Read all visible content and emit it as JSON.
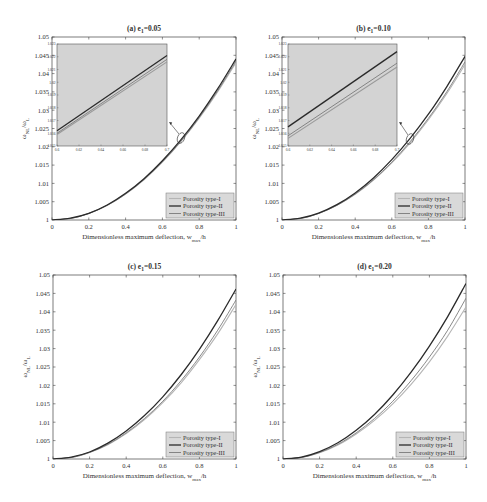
{
  "figure": {
    "xlabel": "Dimensionless maximum deflection, w",
    "xlabel_sub": "max",
    "xlabel_tail": "/h",
    "ylabel_main": "ω",
    "ylabel_sub1": "NL",
    "ylabel_mid": "/ω",
    "ylabel_sub2": "L",
    "legend": [
      "Porosity type-I",
      "Porosity type-II",
      "Porosity type-III"
    ],
    "colors": {
      "type_I": "#b5b5b5",
      "type_II": "#2a2a2a",
      "type_III": "#7a7a7a",
      "inset_bg": "#d3d3d3",
      "legend_bg": "#d9d9d9"
    }
  },
  "chart_data": [
    {
      "type": "line",
      "title": "(a) e1=0.05",
      "title_prefix": "(a) e",
      "title_sub": "1",
      "title_suffix": "=0.05",
      "xlabel": "Dimensionless maximum deflection, w_max/h",
      "ylabel": "ω_NL/ω_L",
      "xlim": [
        0,
        1
      ],
      "ylim": [
        1,
        1.05
      ],
      "xticks": [
        "0",
        "0.2",
        "0.4",
        "0.6",
        "0.8",
        "1"
      ],
      "yticks": [
        "1",
        "1.005",
        "1.01",
        "1.015",
        "1.02",
        "1.025",
        "1.03",
        "1.035",
        "1.04",
        "1.045",
        "1.05"
      ],
      "x": [
        0,
        0.1,
        0.2,
        0.3,
        0.4,
        0.5,
        0.6,
        0.7,
        0.8,
        0.9,
        1.0
      ],
      "series": [
        {
          "name": "Porosity type-I",
          "values": [
            1,
            1.0004,
            1.0018,
            1.004,
            1.0071,
            1.011,
            1.0158,
            1.0214,
            1.0278,
            1.035,
            1.043
          ]
        },
        {
          "name": "Porosity type-II",
          "values": [
            1,
            1.0005,
            1.0018,
            1.0041,
            1.0073,
            1.0113,
            1.0162,
            1.0219,
            1.0284,
            1.0358,
            1.044
          ]
        },
        {
          "name": "Porosity type-III",
          "values": [
            1,
            1.0004,
            1.0018,
            1.004,
            1.0071,
            1.0111,
            1.0159,
            1.0215,
            1.028,
            1.0353,
            1.0434
          ]
        }
      ],
      "inset": {
        "xlim": [
          0.6,
          0.7
        ],
        "ylim": [
          1.015,
          1.023
        ],
        "xticks": [
          "0.6",
          "0.62",
          "0.64",
          "0.66",
          "0.68",
          "0.7"
        ],
        "yticks": [
          "1.015",
          "1.016",
          "1.017",
          "1.018",
          "1.019",
          "1.02",
          "1.021",
          "1.022",
          "1.023"
        ],
        "x": [
          0.6,
          0.7
        ],
        "series": [
          {
            "name": "Porosity type-I",
            "values": [
              1.0159,
              1.0216
            ]
          },
          {
            "name": "Porosity type-II",
            "values": [
              1.0162,
              1.0221
            ]
          },
          {
            "name": "Porosity type-III",
            "values": [
              1.016,
              1.0218
            ]
          }
        ]
      },
      "legend_position": "lower right",
      "grid": false
    },
    {
      "type": "line",
      "title": "(b) e1=0.10",
      "title_prefix": "(b) e",
      "title_sub": "1",
      "title_suffix": "=0.10",
      "xlabel": "Dimensionless maximum deflection, w_max/h",
      "ylabel": "ω_NL/ω_L",
      "xlim": [
        0,
        1
      ],
      "ylim": [
        1,
        1.05
      ],
      "xticks": [
        "0",
        "0.2",
        "0.4",
        "0.6",
        "0.8",
        "1"
      ],
      "yticks": [
        "1",
        "1.005",
        "1.01",
        "1.015",
        "1.02",
        "1.025",
        "1.03",
        "1.035",
        "1.04",
        "1.045",
        "1.05"
      ],
      "x": [
        0,
        0.1,
        0.2,
        0.3,
        0.4,
        0.5,
        0.6,
        0.7,
        0.8,
        0.9,
        1.0
      ],
      "series": [
        {
          "name": "Porosity type-I",
          "values": [
            1,
            1.0004,
            1.0018,
            1.004,
            1.007,
            1.0109,
            1.0156,
            1.0211,
            1.0274,
            1.0345,
            1.0425
          ]
        },
        {
          "name": "Porosity type-II",
          "values": [
            1,
            1.0005,
            1.0019,
            1.0042,
            1.0074,
            1.0115,
            1.0165,
            1.0223,
            1.0289,
            1.0364,
            1.0447
          ]
        },
        {
          "name": "Porosity type-III",
          "values": [
            1,
            1.0004,
            1.0018,
            1.004,
            1.0071,
            1.011,
            1.0158,
            1.0214,
            1.0278,
            1.035,
            1.0432
          ]
        }
      ],
      "inset": {
        "xlim": [
          0.6,
          0.7
        ],
        "ylim": [
          1.015,
          1.023
        ],
        "xticks": [
          "0.6",
          "0.62",
          "0.64",
          "0.66",
          "0.68",
          "0.7"
        ],
        "yticks": [
          "1.015",
          "1.016",
          "1.017",
          "1.018",
          "1.019",
          "1.02",
          "1.021",
          "1.022",
          "1.023"
        ],
        "x": [
          0.6,
          0.7
        ],
        "series": [
          {
            "name": "Porosity type-I",
            "values": [
              1.0156,
              1.0212
            ]
          },
          {
            "name": "Porosity type-II",
            "values": [
              1.0165,
              1.0224
            ]
          },
          {
            "name": "Porosity type-III",
            "values": [
              1.0158,
              1.0215
            ]
          }
        ]
      },
      "legend_position": "lower right",
      "grid": false
    },
    {
      "type": "line",
      "title": "(c) e1=0.15",
      "title_prefix": "(c) e",
      "title_sub": "1",
      "title_suffix": "=0.15",
      "xlabel": "Dimensionless maximum deflection, w_max/h",
      "ylabel": "ω_NL/ω_L",
      "xlim": [
        0,
        1
      ],
      "ylim": [
        1,
        1.05
      ],
      "xticks": [
        "0",
        "0.2",
        "0.4",
        "0.6",
        "0.8",
        "1"
      ],
      "yticks": [
        "1",
        "1.005",
        "1.01",
        "1.015",
        "1.02",
        "1.025",
        "1.03",
        "1.035",
        "1.04",
        "1.045",
        "1.05"
      ],
      "x": [
        0,
        0.1,
        0.2,
        0.3,
        0.4,
        0.5,
        0.6,
        0.7,
        0.8,
        0.9,
        1.0
      ],
      "series": [
        {
          "name": "Porosity type-I",
          "values": [
            1,
            1.0004,
            1.0018,
            1.0039,
            1.0069,
            1.0107,
            1.0153,
            1.0207,
            1.027,
            1.034,
            1.042
          ]
        },
        {
          "name": "Porosity type-II",
          "values": [
            1,
            1.0005,
            1.0019,
            1.0043,
            1.0076,
            1.0118,
            1.0169,
            1.0229,
            1.0298,
            1.0376,
            1.0462
          ]
        },
        {
          "name": "Porosity type-III",
          "values": [
            1,
            1.0004,
            1.0018,
            1.004,
            1.0071,
            1.011,
            1.0157,
            1.0213,
            1.0277,
            1.035,
            1.0432
          ]
        }
      ],
      "legend_position": "lower right",
      "grid": false
    },
    {
      "type": "line",
      "title": "(d) e1=0.20",
      "title_prefix": "(d) e",
      "title_sub": "1",
      "title_suffix": "=0.20",
      "xlabel": "Dimensionless maximum deflection, w_max/h",
      "ylabel": "ω_NL/ω_L",
      "xlim": [
        0,
        1
      ],
      "ylim": [
        1,
        1.05
      ],
      "xticks": [
        "0",
        "0.2",
        "0.4",
        "0.6",
        "0.8",
        "1"
      ],
      "yticks": [
        "1",
        "1.005",
        "1.01",
        "1.015",
        "1.02",
        "1.025",
        "1.03",
        "1.035",
        "1.04",
        "1.045",
        "1.05"
      ],
      "x": [
        0,
        0.1,
        0.2,
        0.3,
        0.4,
        0.5,
        0.6,
        0.7,
        0.8,
        0.9,
        1.0
      ],
      "series": [
        {
          "name": "Porosity type-I",
          "values": [
            1,
            1.0004,
            1.0017,
            1.0038,
            1.0068,
            1.0105,
            1.015,
            1.0203,
            1.0264,
            1.0334,
            1.0413
          ]
        },
        {
          "name": "Porosity type-II",
          "values": [
            1,
            1.0005,
            1.002,
            1.0044,
            1.0078,
            1.0121,
            1.0174,
            1.0236,
            1.0307,
            1.0387,
            1.0477
          ]
        },
        {
          "name": "Porosity type-III",
          "values": [
            1,
            1.0004,
            1.0018,
            1.004,
            1.0071,
            1.011,
            1.0157,
            1.0213,
            1.0277,
            1.035,
            1.0437
          ]
        }
      ],
      "legend_position": "lower right",
      "grid": false
    }
  ]
}
